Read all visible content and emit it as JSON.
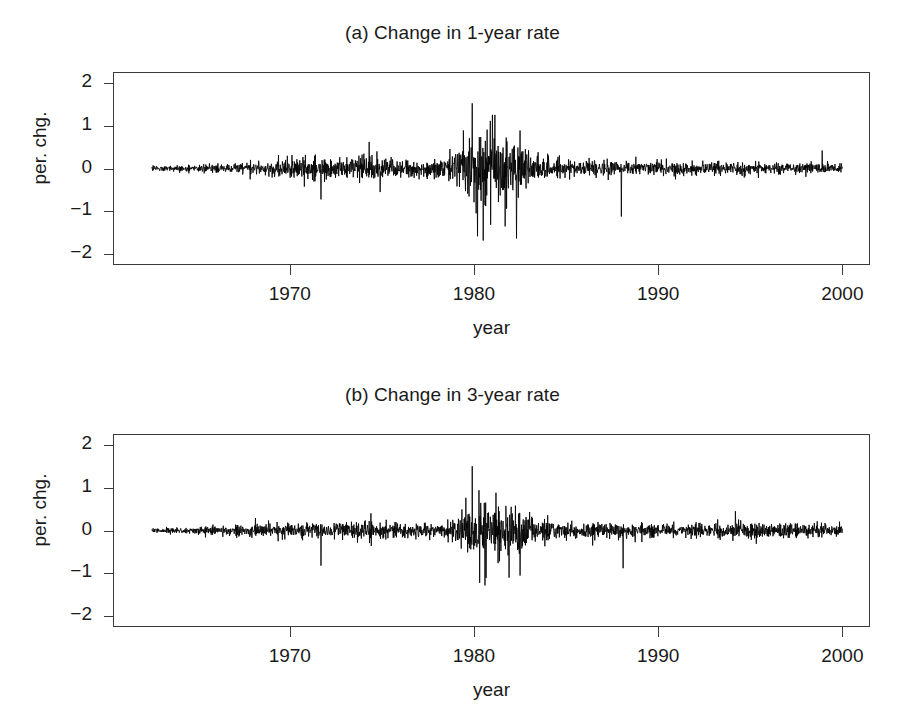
{
  "figure": {
    "background": "#ffffff",
    "line_color": "#000000",
    "axis_color": "#3a3a3a",
    "text_color": "#1a1a1a"
  },
  "panels": [
    {
      "id": "panel-a",
      "title": "(a) Change in 1-year rate",
      "xlabel": "year",
      "ylabel": "per. chg."
    },
    {
      "id": "panel-b",
      "title": "(b) Change in 3-year rate",
      "xlabel": "year",
      "ylabel": "per. chg."
    }
  ],
  "axes": {
    "y_ticks": [
      {
        "value": 2,
        "label": "2"
      },
      {
        "value": 1,
        "label": "1"
      },
      {
        "value": 0,
        "label": "0"
      },
      {
        "value": -1,
        "label": "−1"
      },
      {
        "value": -2,
        "label": "−2"
      }
    ],
    "x_ticks": [
      {
        "value": 1970,
        "label": "1970"
      },
      {
        "value": 1980,
        "label": "1980"
      },
      {
        "value": 1990,
        "label": "1990"
      },
      {
        "value": 2000,
        "label": "2000"
      }
    ],
    "xlim": [
      1960.4,
      2001.5
    ],
    "ylim": [
      -2.25,
      2.25
    ],
    "grid": false,
    "box": true
  },
  "chart_data": {
    "type": "line",
    "xlabel": "year",
    "ylabel": "per. chg.",
    "xlim": [
      1960.4,
      2001.5
    ],
    "ylim": [
      -2.25,
      2.25
    ],
    "grid": false,
    "legend": null,
    "x_tick_labels": [
      "1970",
      "1980",
      "1990",
      "2000"
    ],
    "y_tick_labels": [
      "2",
      "1",
      "0",
      "−1",
      "−2"
    ],
    "sampling": {
      "frequency": "weekly",
      "points_per_year": 52,
      "x_start": 1962.5,
      "x_end": 2000.0
    },
    "series": [
      {
        "name": "(a) Change in 1-year rate",
        "panel": "panel-a",
        "mean": 0.0,
        "observed_min": -1.68,
        "observed_max": 1.52,
        "seed": 20240117,
        "volatility_profile": [
          {
            "year": 1962.5,
            "sigma": 0.03
          },
          {
            "year": 1965.0,
            "sigma": 0.04
          },
          {
            "year": 1967.0,
            "sigma": 0.06
          },
          {
            "year": 1969.0,
            "sigma": 0.1
          },
          {
            "year": 1970.5,
            "sigma": 0.12
          },
          {
            "year": 1972.0,
            "sigma": 0.11
          },
          {
            "year": 1974.0,
            "sigma": 0.15
          },
          {
            "year": 1975.5,
            "sigma": 0.12
          },
          {
            "year": 1977.0,
            "sigma": 0.1
          },
          {
            "year": 1978.5,
            "sigma": 0.12
          },
          {
            "year": 1979.6,
            "sigma": 0.33
          },
          {
            "year": 1980.2,
            "sigma": 0.52
          },
          {
            "year": 1980.9,
            "sigma": 0.47
          },
          {
            "year": 1981.6,
            "sigma": 0.44
          },
          {
            "year": 1982.4,
            "sigma": 0.36
          },
          {
            "year": 1983.2,
            "sigma": 0.15
          },
          {
            "year": 1984.5,
            "sigma": 0.11
          },
          {
            "year": 1986.0,
            "sigma": 0.085
          },
          {
            "year": 1988.0,
            "sigma": 0.08
          },
          {
            "year": 1990.0,
            "sigma": 0.075
          },
          {
            "year": 1992.0,
            "sigma": 0.07
          },
          {
            "year": 1994.5,
            "sigma": 0.075
          },
          {
            "year": 1996.5,
            "sigma": 0.065
          },
          {
            "year": 1998.5,
            "sigma": 0.07
          },
          {
            "year": 2000.0,
            "sigma": 0.06
          }
        ],
        "notable_points": [
          {
            "year": 1971.7,
            "value": -0.72
          },
          {
            "year": 1974.3,
            "value": 0.62
          },
          {
            "year": 1974.9,
            "value": -0.55
          },
          {
            "year": 1979.9,
            "value": 1.52
          },
          {
            "year": 1980.2,
            "value": -1.58
          },
          {
            "year": 1980.5,
            "value": -1.68
          },
          {
            "year": 1981.0,
            "value": 1.25
          },
          {
            "year": 1981.7,
            "value": -1.35
          },
          {
            "year": 1982.3,
            "value": -1.63
          },
          {
            "year": 1988.0,
            "value": -1.12
          },
          {
            "year": 1998.9,
            "value": 0.42
          }
        ]
      },
      {
        "name": "(b) Change in 3-year rate",
        "panel": "panel-b",
        "mean": 0.0,
        "observed_min": -1.28,
        "observed_max": 1.5,
        "seed": 71113197,
        "volatility_profile": [
          {
            "year": 1962.5,
            "sigma": 0.028
          },
          {
            "year": 1965.0,
            "sigma": 0.04
          },
          {
            "year": 1967.0,
            "sigma": 0.06
          },
          {
            "year": 1969.0,
            "sigma": 0.085
          },
          {
            "year": 1970.5,
            "sigma": 0.095
          },
          {
            "year": 1972.0,
            "sigma": 0.09
          },
          {
            "year": 1974.0,
            "sigma": 0.11
          },
          {
            "year": 1975.5,
            "sigma": 0.095
          },
          {
            "year": 1977.0,
            "sigma": 0.08
          },
          {
            "year": 1978.5,
            "sigma": 0.095
          },
          {
            "year": 1979.6,
            "sigma": 0.23
          },
          {
            "year": 1980.2,
            "sigma": 0.4
          },
          {
            "year": 1980.9,
            "sigma": 0.36
          },
          {
            "year": 1981.6,
            "sigma": 0.33
          },
          {
            "year": 1982.4,
            "sigma": 0.28
          },
          {
            "year": 1983.2,
            "sigma": 0.14
          },
          {
            "year": 1984.5,
            "sigma": 0.11
          },
          {
            "year": 1986.0,
            "sigma": 0.095
          },
          {
            "year": 1988.0,
            "sigma": 0.09
          },
          {
            "year": 1990.0,
            "sigma": 0.085
          },
          {
            "year": 1992.0,
            "sigma": 0.08
          },
          {
            "year": 1994.5,
            "sigma": 0.09
          },
          {
            "year": 1996.5,
            "sigma": 0.08
          },
          {
            "year": 1998.5,
            "sigma": 0.085
          },
          {
            "year": 2000.0,
            "sigma": 0.07
          }
        ],
        "notable_points": [
          {
            "year": 1971.7,
            "value": -0.82
          },
          {
            "year": 1974.4,
            "value": 0.4
          },
          {
            "year": 1979.9,
            "value": 1.5
          },
          {
            "year": 1980.3,
            "value": -1.22
          },
          {
            "year": 1980.6,
            "value": -1.28
          },
          {
            "year": 1981.2,
            "value": 0.88
          },
          {
            "year": 1981.9,
            "value": -1.1
          },
          {
            "year": 1982.5,
            "value": -1.05
          },
          {
            "year": 1988.1,
            "value": -0.88
          },
          {
            "year": 1994.2,
            "value": 0.45
          }
        ]
      }
    ]
  }
}
